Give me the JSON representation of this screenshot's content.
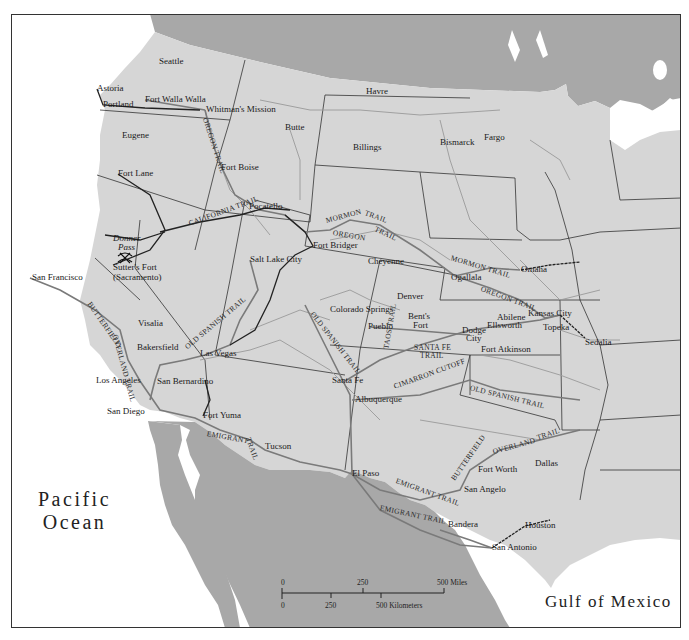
{
  "map": {
    "colors": {
      "us_land": "#d6d6d6",
      "foreign_land": "#a8a8a8",
      "water": "#ffffff",
      "trail": "#7a7a7a",
      "route_black": "#222222",
      "state_border": "#333333",
      "river": "#9a9a9a"
    },
    "water_labels": {
      "pacific_line1": "Pacific",
      "pacific_line2": "Ocean",
      "gulf": "Gulf of Mexico"
    },
    "cities": [
      {
        "name": "Seattle",
        "x": 159,
        "y": 62
      },
      {
        "name": "Astoria",
        "x": 97,
        "y": 89
      },
      {
        "name": "Portland",
        "x": 103,
        "y": 105
      },
      {
        "name": "Fort Walla Walla",
        "x": 145,
        "y": 100
      },
      {
        "name": "Whitman's Mission",
        "x": 206,
        "y": 110
      },
      {
        "name": "Eugene",
        "x": 122,
        "y": 136
      },
      {
        "name": "Butte",
        "x": 285,
        "y": 128
      },
      {
        "name": "Havre",
        "x": 366,
        "y": 92
      },
      {
        "name": "Billings",
        "x": 353,
        "y": 148
      },
      {
        "name": "Bismarck",
        "x": 440,
        "y": 143
      },
      {
        "name": "Fargo",
        "x": 484,
        "y": 138
      },
      {
        "name": "Fort Boise",
        "x": 221,
        "y": 168
      },
      {
        "name": "Fort Lane",
        "x": 118,
        "y": 174
      },
      {
        "name": "Pocatello",
        "x": 249,
        "y": 207
      },
      {
        "name": "Fort Bridger",
        "x": 313,
        "y": 246
      },
      {
        "name": "Salt Lake City",
        "x": 250,
        "y": 260
      },
      {
        "name": "Cheyenne",
        "x": 368,
        "y": 262
      },
      {
        "name": "Ogallala",
        "x": 451,
        "y": 278
      },
      {
        "name": "Omaha",
        "x": 521,
        "y": 270
      },
      {
        "name": "Sutter's Fort",
        "x": 113,
        "y": 268
      },
      {
        "name": "(Sacramento)",
        "x": 113,
        "y": 278
      },
      {
        "name": "San Francisco",
        "x": 32,
        "y": 278
      },
      {
        "name": "Denver",
        "x": 397,
        "y": 297
      },
      {
        "name": "Colorado Springs",
        "x": 330,
        "y": 310
      },
      {
        "name": "Pueblo",
        "x": 368,
        "y": 327
      },
      {
        "name": "Bent's",
        "x": 408,
        "y": 317
      },
      {
        "name": "Fort",
        "x": 413,
        "y": 326
      },
      {
        "name": "Abilene",
        "x": 497,
        "y": 318
      },
      {
        "name": "Ellsworth",
        "x": 487,
        "y": 326
      },
      {
        "name": "Kansas City",
        "x": 528,
        "y": 314
      },
      {
        "name": "Topeka",
        "x": 543,
        "y": 328
      },
      {
        "name": "Sedalia",
        "x": 585,
        "y": 343
      },
      {
        "name": "Dodge",
        "x": 462,
        "y": 331
      },
      {
        "name": "City",
        "x": 466,
        "y": 339
      },
      {
        "name": "Fort Atkinson",
        "x": 481,
        "y": 350
      },
      {
        "name": "Visalia",
        "x": 138,
        "y": 324
      },
      {
        "name": "Bakersfield",
        "x": 137,
        "y": 348
      },
      {
        "name": "Las Vegas",
        "x": 200,
        "y": 354
      },
      {
        "name": "Los Angeles",
        "x": 96,
        "y": 381
      },
      {
        "name": "San Bernardino",
        "x": 157,
        "y": 382
      },
      {
        "name": "Santa Fe",
        "x": 332,
        "y": 381
      },
      {
        "name": "Albuquerque",
        "x": 355,
        "y": 400
      },
      {
        "name": "San Diego",
        "x": 107,
        "y": 412
      },
      {
        "name": "Fort Yuma",
        "x": 203,
        "y": 416
      },
      {
        "name": "Tucson",
        "x": 265,
        "y": 447
      },
      {
        "name": "El Paso",
        "x": 352,
        "y": 474
      },
      {
        "name": "Fort Worth",
        "x": 478,
        "y": 470
      },
      {
        "name": "Dallas",
        "x": 535,
        "y": 464
      },
      {
        "name": "San Angelo",
        "x": 464,
        "y": 490
      },
      {
        "name": "Bandera",
        "x": 448,
        "y": 525
      },
      {
        "name": "Houston",
        "x": 525,
        "y": 526
      },
      {
        "name": "San Antonio",
        "x": 492,
        "y": 548
      }
    ],
    "places_italic": [
      {
        "name": "Donner",
        "x": 113,
        "y": 239
      },
      {
        "name": "Pass",
        "x": 118,
        "y": 248
      }
    ],
    "trails": [
      {
        "name": "OREGON TRAIL",
        "x": 205,
        "y": 118,
        "rot": 72
      },
      {
        "name": "CALIFORNIA TRAIL",
        "x": 189,
        "y": 224,
        "rot": -20
      },
      {
        "name": "MORMON",
        "x": 326,
        "y": 221,
        "rot": -15
      },
      {
        "name": "TRAIL",
        "x": 365,
        "y": 213,
        "rot": 20
      },
      {
        "name": "OREGON",
        "x": 333,
        "y": 233,
        "rot": 10
      },
      {
        "name": "TRAIL",
        "x": 375,
        "y": 229,
        "rot": 25
      },
      {
        "name": "MORMON TRAIL",
        "x": 451,
        "y": 258,
        "rot": 17
      },
      {
        "name": "OREGON TRAIL",
        "x": 481,
        "y": 289,
        "rot": 20
      },
      {
        "name": "BUTTERFIELD",
        "x": 89,
        "y": 303,
        "rot": 55
      },
      {
        "name": "OVERLAND TRAIL",
        "x": 115,
        "y": 335,
        "rot": 75
      },
      {
        "name": "OLD SPANISH TRAIL",
        "x": 186,
        "y": 348,
        "rot": -40
      },
      {
        "name": "OLD SPANISH TRAIL",
        "x": 312,
        "y": 313,
        "rot": 52
      },
      {
        "name": "TAOS TRAIL",
        "x": 386,
        "y": 349,
        "rot": -80
      },
      {
        "name": "SANTA FE",
        "x": 414,
        "y": 348,
        "rot": 0
      },
      {
        "name": "TRAIL",
        "x": 420,
        "y": 356,
        "rot": 0
      },
      {
        "name": "CIMARRON CUTOFF",
        "x": 394,
        "y": 387,
        "rot": -20
      },
      {
        "name": "OLD SPANISH TRAIL",
        "x": 470,
        "y": 388,
        "rot": 14
      },
      {
        "name": "EMIGRANT",
        "x": 207,
        "y": 434,
        "rot": 10
      },
      {
        "name": "TRAIL",
        "x": 248,
        "y": 438,
        "rot": 70
      },
      {
        "name": "BUTTERFIELD",
        "x": 453,
        "y": 480,
        "rot": -55
      },
      {
        "name": "OVERLAND",
        "x": 493,
        "y": 452,
        "rot": -15
      },
      {
        "name": "TRAIL",
        "x": 537,
        "y": 438,
        "rot": -18
      },
      {
        "name": "EMIGRANT TRAIL",
        "x": 396,
        "y": 481,
        "rot": 20
      },
      {
        "name": "EMIGRANT TRAIL",
        "x": 380,
        "y": 508,
        "rot": 12
      }
    ],
    "scale_bar": {
      "miles_ticks": [
        "0",
        "250",
        "500 Miles"
      ],
      "km_ticks": [
        "0",
        "250",
        "500 Kilometers"
      ]
    }
  }
}
